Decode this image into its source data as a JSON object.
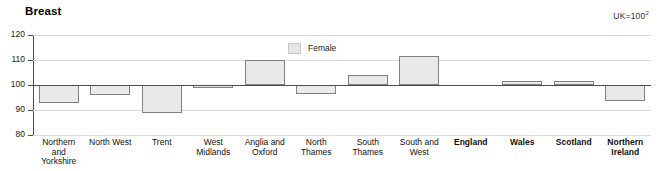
{
  "title": "Breast",
  "note": {
    "text": "UK=100",
    "superscript": "2"
  },
  "legend": {
    "swatch_color": "#e6e6e6",
    "label": "Female",
    "position": "top-center"
  },
  "axis": {
    "y_ticks": [
      "120",
      "110",
      "100",
      "90",
      "80"
    ],
    "y_min": 80,
    "y_max": 120
  },
  "chart_data": {
    "type": "bar",
    "title": "Breast",
    "subtitle": "UK=100",
    "xlabel": "",
    "ylabel": "",
    "ylim": [
      80,
      120
    ],
    "yticks": [
      80,
      90,
      100,
      110,
      120
    ],
    "grid": true,
    "baseline": 100,
    "legend_position": "top-center",
    "categories": [
      "Northern and Yorkshire",
      "North West",
      "Trent",
      "West Midlands",
      "Anglia and Oxford",
      "North Thames",
      "South Thames",
      "South and West",
      "England",
      "Wales",
      "Scotland",
      "Northern Ireland"
    ],
    "category_labels": [
      {
        "lines": [
          "Northern",
          "and",
          "Yorkshire"
        ],
        "bold": false
      },
      {
        "lines": [
          "North West"
        ],
        "bold": false
      },
      {
        "lines": [
          "Trent"
        ],
        "bold": false
      },
      {
        "lines": [
          "West",
          "Midlands"
        ],
        "bold": false
      },
      {
        "lines": [
          "Anglia and",
          "Oxford"
        ],
        "bold": false
      },
      {
        "lines": [
          "North",
          "Thames"
        ],
        "bold": false
      },
      {
        "lines": [
          "South",
          "Thames"
        ],
        "bold": false
      },
      {
        "lines": [
          "South and",
          "West"
        ],
        "bold": false
      },
      {
        "lines": [
          "England"
        ],
        "bold": true
      },
      {
        "lines": [
          "Wales"
        ],
        "bold": true
      },
      {
        "lines": [
          "Scotland"
        ],
        "bold": true
      },
      {
        "lines": [
          "Northern",
          "Ireland"
        ],
        "bold": true
      }
    ],
    "series": [
      {
        "name": "Female",
        "color": "#e9e9e9",
        "values": [
          93.0,
          96.0,
          89.0,
          99.0,
          110.0,
          96.5,
          104.0,
          111.5,
          100.0,
          101.5,
          101.5,
          93.5
        ]
      }
    ]
  }
}
